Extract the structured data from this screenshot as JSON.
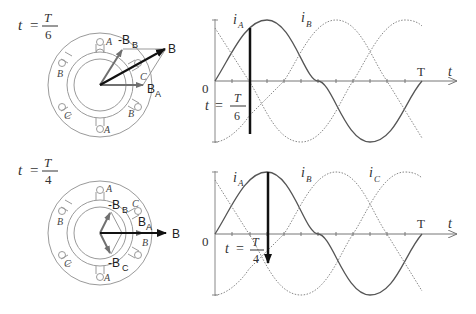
{
  "panels": [
    {
      "time_label": {
        "t": "t",
        "eq": "=",
        "num": "T",
        "den": "6"
      },
      "vectors": {
        "resultant": "B",
        "phase_a": "B",
        "phase_a_sub": "A",
        "neg_phase_b": "-B",
        "neg_phase_b_sub": "B"
      },
      "slot_labels": [
        "A",
        "C",
        "B",
        "A",
        "C",
        "B"
      ],
      "waveform": {
        "label_a": "i",
        "label_a_sub": "A",
        "label_b": "i",
        "label_b_sub": "B",
        "origin": "0",
        "period": "T",
        "axis": "t",
        "marker": {
          "t": "t",
          "eq": "=",
          "num": "T",
          "den": "6"
        }
      }
    },
    {
      "time_label": {
        "t": "t",
        "eq": "=",
        "num": "T",
        "den": "4"
      },
      "vectors": {
        "resultant": "B",
        "phase_a": "B",
        "phase_a_sub": "A",
        "neg_phase_b": "-B",
        "neg_phase_b_sub": "B",
        "neg_phase_c": "-B",
        "neg_phase_c_sub": "C"
      },
      "slot_labels": [
        "A",
        "C",
        "B",
        "A",
        "C",
        "B"
      ],
      "waveform": {
        "label_a": "i",
        "label_a_sub": "A",
        "label_b": "i",
        "label_b_sub": "B",
        "label_c": "i",
        "label_c_sub": "C",
        "origin": "0",
        "period": "T",
        "axis": "t",
        "marker": {
          "t": "t",
          "eq": "=",
          "num": "T",
          "den": "4"
        }
      }
    }
  ],
  "colors": {
    "stator": "#9a9a9a",
    "phase_vector": "#707070",
    "resultant": "#111111",
    "curve": "#555555",
    "dotted_curve": "#888888"
  }
}
